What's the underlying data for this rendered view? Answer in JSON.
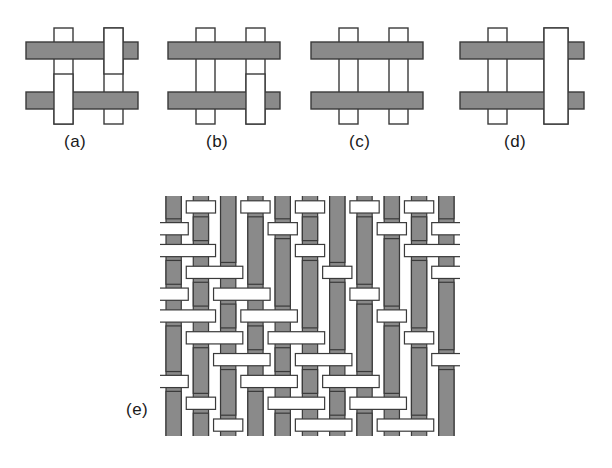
{
  "figure": {
    "background_color": "#ffffff",
    "warp_color": "#8a8a8a",
    "weft_color": "#ffffff",
    "stroke_color": "#3a3a3a"
  },
  "panels": [
    {
      "id": "a",
      "label": "(a)",
      "description": "plain weave unit cell",
      "crossings": [
        {
          "row": 0,
          "col": 0,
          "over": "horizontal"
        },
        {
          "row": 0,
          "col": 1,
          "over": "vertical"
        },
        {
          "row": 1,
          "col": 0,
          "over": "vertical"
        },
        {
          "row": 1,
          "col": 1,
          "over": "horizontal"
        }
      ]
    },
    {
      "id": "b",
      "label": "(b)",
      "description": "twill weave unit cell",
      "crossings": [
        {
          "row": 0,
          "col": 0,
          "over": "horizontal"
        },
        {
          "row": 0,
          "col": 1,
          "over": "horizontal"
        },
        {
          "row": 1,
          "col": 0,
          "over": "horizontal"
        },
        {
          "row": 1,
          "col": 1,
          "over": "vertical"
        }
      ]
    },
    {
      "id": "c",
      "label": "(c)",
      "description": "all horizontal floats unit cell",
      "crossings": [
        {
          "row": 0,
          "col": 0,
          "over": "horizontal"
        },
        {
          "row": 0,
          "col": 1,
          "over": "horizontal"
        },
        {
          "row": 1,
          "col": 0,
          "over": "horizontal"
        },
        {
          "row": 1,
          "col": 1,
          "over": "horizontal"
        }
      ]
    },
    {
      "id": "d",
      "label": "(d)",
      "description": "wide vertical float unit cell",
      "crossings": [
        {
          "row": 0,
          "col": 0,
          "over": "horizontal"
        },
        {
          "row": 0,
          "col": 1,
          "over": "vertical"
        },
        {
          "row": 1,
          "col": 0,
          "over": "horizontal"
        },
        {
          "row": 1,
          "col": 1,
          "over": "vertical"
        }
      ]
    }
  ],
  "large_panel": {
    "id": "e",
    "label": "(e)",
    "description": "full twill fabric weave",
    "warp_count": 11,
    "weft_count": 11,
    "weave_matrix": [
      [
        1,
        0,
        1,
        0,
        1,
        0,
        1,
        0,
        1,
        0,
        1
      ],
      [
        0,
        1,
        1,
        1,
        0,
        1,
        1,
        1,
        0,
        1,
        0
      ],
      [
        0,
        0,
        1,
        1,
        1,
        0,
        1,
        1,
        1,
        0,
        0
      ],
      [
        1,
        0,
        0,
        1,
        1,
        1,
        0,
        1,
        1,
        1,
        0
      ],
      [
        0,
        1,
        0,
        0,
        1,
        1,
        1,
        0,
        1,
        1,
        1
      ],
      [
        0,
        0,
        1,
        0,
        0,
        1,
        1,
        1,
        0,
        1,
        1
      ],
      [
        1,
        0,
        0,
        1,
        0,
        0,
        1,
        1,
        1,
        0,
        1
      ],
      [
        1,
        1,
        0,
        0,
        1,
        0,
        0,
        1,
        1,
        1,
        0
      ],
      [
        0,
        1,
        1,
        0,
        0,
        1,
        0,
        0,
        1,
        1,
        1
      ],
      [
        1,
        0,
        1,
        1,
        0,
        0,
        1,
        0,
        0,
        1,
        1
      ],
      [
        1,
        1,
        0,
        1,
        1,
        0,
        0,
        1,
        0,
        0,
        1
      ]
    ],
    "matrix_legend": {
      "1": "warp (gray vertical) on top",
      "0": "weft (white horizontal) on top"
    }
  }
}
